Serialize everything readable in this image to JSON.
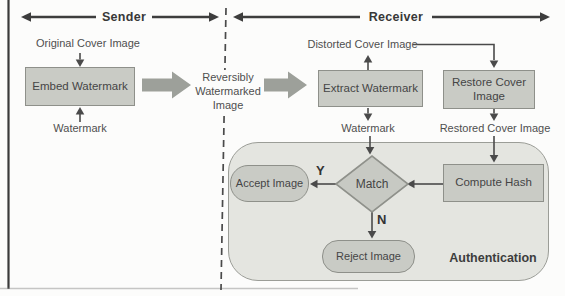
{
  "colors": {
    "node_fill": "#c9cbc5",
    "node_border": "#8e908a",
    "auth_container_fill": "#e4e5e0",
    "block_arrow_fill": "#9da09a",
    "line_color": "#4a4a4a",
    "text_color": "#4f4f4f"
  },
  "header": {
    "sender_label": "Sender",
    "receiver_label": "Receiver"
  },
  "sender": {
    "input_top_label": "Original Cover Image",
    "embed_box_label": "Embed Watermark",
    "input_bottom_label": "Watermark"
  },
  "transfer": {
    "label": "Reversibly Watermarked Image"
  },
  "receiver": {
    "distorted_label": "Distorted Cover Image",
    "extract_box_label": "Extract Watermark",
    "restore_box_label": "Restore Cover Image",
    "watermark_label": "Watermark",
    "restored_label": "Restored Cover Image"
  },
  "authentication": {
    "container_label": "Authentication",
    "accept_label": "Accept Image",
    "match_label": "Match",
    "compute_hash_label": "Compute Hash",
    "reject_label": "Reject Image",
    "yes_label": "Y",
    "no_label": "N"
  }
}
